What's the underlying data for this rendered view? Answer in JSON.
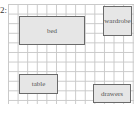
{
  "figure_label": "2:",
  "plan": {
    "type": "room-layout-grid",
    "items": [
      {
        "label": "bed"
      },
      {
        "label": "wardrobe"
      },
      {
        "label": "table"
      },
      {
        "label": "drawers"
      }
    ]
  }
}
